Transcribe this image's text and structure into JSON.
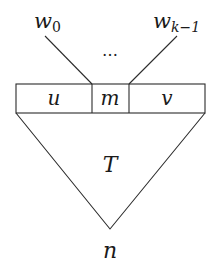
{
  "diagram": {
    "type": "tree-schematic",
    "inputs": {
      "first": {
        "base": "w",
        "subscript": "0"
      },
      "last": {
        "base": "w",
        "subscript": "k−1"
      },
      "ellipsis": "…"
    },
    "box": {
      "cells": [
        {
          "label": "u"
        },
        {
          "label": "m"
        },
        {
          "label": "v"
        }
      ]
    },
    "tree": {
      "label": "T"
    },
    "root": {
      "label": "n"
    },
    "colors": {
      "stroke": "#2b2b2b",
      "text": "#1a1a1a",
      "background": "#ffffff"
    }
  }
}
